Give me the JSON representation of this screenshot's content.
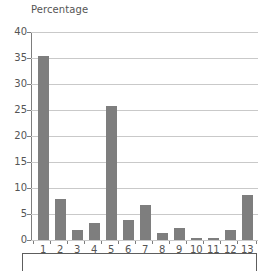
{
  "chart_data": {
    "type": "bar",
    "title": "",
    "ylabel": "Percentage",
    "xlabel": "",
    "categories": [
      "1",
      "2",
      "3",
      "4",
      "5",
      "6",
      "7",
      "8",
      "9",
      "10",
      "11",
      "12",
      "13"
    ],
    "values": [
      35.4,
      7.8,
      2.0,
      3.2,
      25.8,
      3.9,
      6.7,
      1.3,
      2.4,
      0.4,
      0.4,
      1.9,
      8.6
    ],
    "ylim": [
      0,
      40
    ],
    "yticks": [
      0,
      5,
      10,
      15,
      20,
      25,
      30,
      35,
      40
    ],
    "ytick_labels": [
      "0",
      "5",
      "10",
      "15",
      "20",
      "25",
      "30",
      "35",
      "40"
    ],
    "grid": true,
    "legend": false,
    "bar_color": "#7e7e7e",
    "gridline_color": "#c9c9c9",
    "axis_color": "#7d7d7d",
    "text_color": "#555555"
  }
}
